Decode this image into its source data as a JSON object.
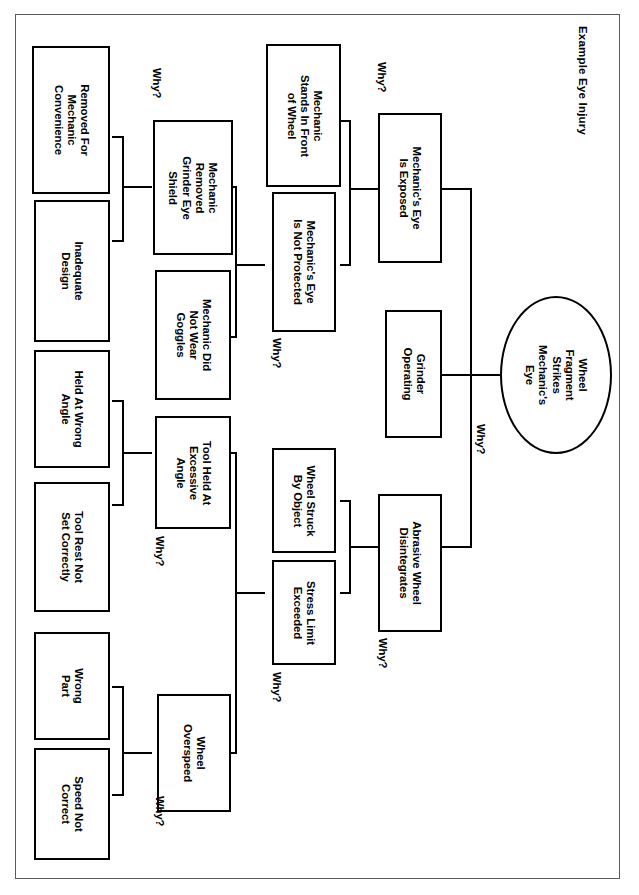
{
  "document": {
    "title": "Example Eye Injury",
    "orientation": "landscape-rotated-90cw",
    "frame": true
  },
  "diagram": {
    "type": "fault-tree-five-whys",
    "root": {
      "id": "root",
      "shape": "oval",
      "label": "Wheel\nFragment\nStrikes\nMechanic's\nEye"
    },
    "why_labels": [
      {
        "id": "why-root",
        "text": "Why?"
      },
      {
        "id": "why-exposed",
        "text": "Why?"
      },
      {
        "id": "why-notprot",
        "text": "Why?"
      },
      {
        "id": "why-shield",
        "text": "Why?"
      },
      {
        "id": "why-disint",
        "text": "Why?"
      },
      {
        "id": "why-stress",
        "text": "Why?"
      },
      {
        "id": "why-toolangle",
        "text": "Why?"
      },
      {
        "id": "why-overspeed",
        "text": "Why?"
      }
    ],
    "levels": [
      {
        "level": 2,
        "nodes": [
          {
            "id": "eye-exposed",
            "label": "Mechanic's Eye\nIs Exposed"
          },
          {
            "id": "grinder-op",
            "label": "Grinder\nOperating"
          },
          {
            "id": "wheel-disint",
            "label": "Abrasive Wheel\nDisintegrates"
          }
        ]
      },
      {
        "level": 3,
        "nodes": [
          {
            "id": "stands-front",
            "label": "Mechanic\nStands In Front\nof Wheel"
          },
          {
            "id": "not-protected",
            "label": "Mechanic's Eye\nIs Not Protected"
          },
          {
            "id": "struck-object",
            "label": "Wheel Struck\nBy Object"
          },
          {
            "id": "stress-limit",
            "label": "Stress Limit\nExceeded"
          }
        ]
      },
      {
        "level": 4,
        "nodes": [
          {
            "id": "removed-shield",
            "label": "Mechanic\nRemoved\nGrinder Eye\nShield"
          },
          {
            "id": "no-goggles",
            "label": "Mechanic Did\nNot Wear\nGoggles"
          },
          {
            "id": "excessive-angle",
            "label": "Tool Held At\nExcessive\nAngle"
          },
          {
            "id": "overspeed",
            "label": "Wheel\nOverspeed"
          }
        ]
      },
      {
        "level": 5,
        "nodes": [
          {
            "id": "convenience",
            "label": "Removed For\nMechanic\nConvenience"
          },
          {
            "id": "inadequate",
            "label": "Inadequate\nDesign"
          },
          {
            "id": "wrong-angle",
            "label": "Held At Wrong\nAngle"
          },
          {
            "id": "tool-rest",
            "label": "Tool Rest Not\nSet Correctly"
          },
          {
            "id": "wrong-part",
            "label": "Wrong\nPart"
          },
          {
            "id": "speed-not",
            "label": "Speed Not\nCorrect"
          }
        ]
      }
    ],
    "colors": {
      "node_border": "#000000",
      "node_fill": "#ffffff",
      "connector": "#000000",
      "frame": "#5b5b5b",
      "text": "#000000"
    }
  }
}
